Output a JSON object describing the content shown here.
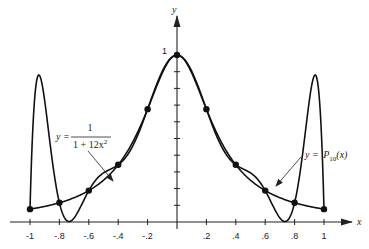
{
  "chart_data": {
    "type": "line",
    "title": "",
    "xlabel": "x",
    "ylabel": "y",
    "xlim": [
      -1,
      1
    ],
    "ylim": [
      0,
      1
    ],
    "grid": false,
    "x_ticks": [
      -1,
      -0.8,
      -0.6,
      -0.4,
      -0.2,
      0.2,
      0.4,
      0.6,
      0.8,
      1
    ],
    "x_tick_labels": [
      "-1",
      "-.8",
      "-.6",
      "-.4",
      "-.2",
      ".2",
      ".4",
      ".6",
      ".8",
      "1"
    ],
    "y_ticks": [
      0.1,
      0.2,
      0.3,
      0.4,
      0.5,
      0.6,
      0.7,
      0.8,
      0.9,
      1.0
    ],
    "y_tick_labels": [
      "1"
    ],
    "series": [
      {
        "name": "y = 1/(1 + 12x^2)",
        "function": "1/(1+12x^2)"
      },
      {
        "name": "y = P10(x)",
        "function": "degree-10 interpolating polynomial at 11 equally spaced nodes"
      }
    ],
    "nodes_x": [
      -1,
      -0.8,
      -0.6,
      -0.4,
      -0.2,
      0,
      0.2,
      0.4,
      0.6,
      0.8,
      1
    ],
    "nodes_y": [
      0.0769,
      0.1152,
      0.188,
      0.3425,
      0.6757,
      1.0,
      0.6757,
      0.3425,
      0.188,
      0.1152,
      0.0769
    ],
    "annotations": [
      {
        "label_prefix": "y =",
        "numerator": "1",
        "denominator": "1 + 12x",
        "exponent": "2",
        "points_to": "runge-function-curve"
      },
      {
        "label_prefix": "y =",
        "func": "P",
        "subscript": "10",
        "arg": "(x)",
        "points_to": "interpolating-polynomial-curve"
      }
    ]
  }
}
